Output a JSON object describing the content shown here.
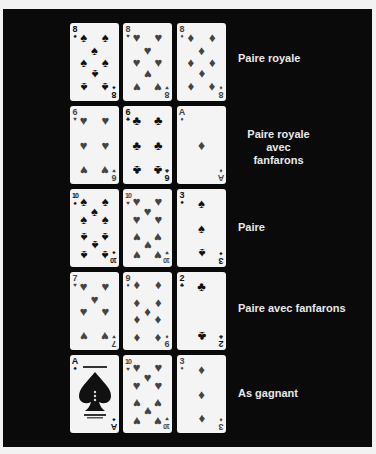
{
  "rows": [
    {
      "label": "Paire royale",
      "cards": [
        {
          "rank": "8",
          "suit": "♠",
          "color": "black"
        },
        {
          "rank": "8",
          "suit": "♥",
          "color": "red"
        },
        {
          "rank": "8",
          "suit": "♦",
          "color": "red"
        }
      ]
    },
    {
      "label": "Paire royale avec fanfarons",
      "label_lines": [
        "Paire royale",
        "avec fanfarons"
      ],
      "cards": [
        {
          "rank": "6",
          "suit": "♥",
          "color": "red"
        },
        {
          "rank": "6",
          "suit": "♣",
          "color": "black"
        },
        {
          "rank": "A",
          "suit": "♦",
          "color": "red"
        }
      ]
    },
    {
      "label": "Paire",
      "cards": [
        {
          "rank": "10",
          "suit": "♠",
          "color": "black"
        },
        {
          "rank": "10",
          "suit": "♥",
          "color": "red"
        },
        {
          "rank": "3",
          "suit": "♠",
          "color": "black"
        }
      ]
    },
    {
      "label": "Paire avec fanfarons",
      "cards": [
        {
          "rank": "7",
          "suit": "♥",
          "color": "red"
        },
        {
          "rank": "9",
          "suit": "♦",
          "color": "red"
        },
        {
          "rank": "2",
          "suit": "♣",
          "color": "black"
        }
      ]
    },
    {
      "label": "As gagnant",
      "cards": [
        {
          "rank": "A",
          "suit": "♠",
          "color": "black"
        },
        {
          "rank": "10",
          "suit": "♥",
          "color": "red"
        },
        {
          "rank": "3",
          "suit": "♦",
          "color": "red"
        }
      ]
    }
  ],
  "colors": {
    "panel": "#0a0a0a",
    "card": "#f4f4f4",
    "label": "#e8e8e8",
    "page": "#f2f2f2"
  }
}
